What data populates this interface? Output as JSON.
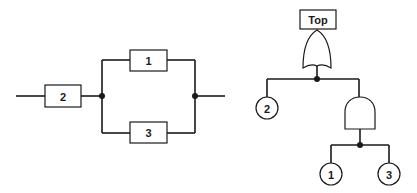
{
  "reliability_block_diagram": {
    "blocks": [
      {
        "id": "block-2",
        "label": "2"
      },
      {
        "id": "block-1",
        "label": "1"
      },
      {
        "id": "block-3",
        "label": "3"
      }
    ]
  },
  "fault_tree": {
    "top_event": {
      "label": "Top"
    },
    "gates": [
      {
        "id": "or-gate",
        "type": "OR"
      },
      {
        "id": "and-gate",
        "type": "AND"
      }
    ],
    "basic_events": [
      {
        "id": "event-2",
        "label": "2"
      },
      {
        "id": "event-1",
        "label": "1"
      },
      {
        "id": "event-3",
        "label": "3"
      }
    ]
  },
  "colors": {
    "line": "#1a1a1a",
    "background": "#ffffff"
  }
}
